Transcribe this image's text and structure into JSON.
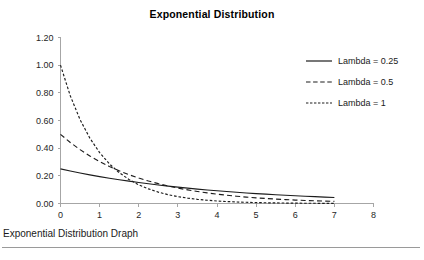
{
  "chart_data": {
    "type": "line",
    "title": "Exponential Distribution",
    "xlabel": "",
    "ylabel": "",
    "xlim": [
      0,
      8
    ],
    "ylim": [
      0,
      1.2
    ],
    "grid": false,
    "legend_position": "right",
    "xticks": [
      "0",
      "1",
      "2",
      "3",
      "4",
      "5",
      "6",
      "7",
      "8"
    ],
    "yticks": [
      "0.00",
      "0.20",
      "0.40",
      "0.60",
      "0.80",
      "1.00",
      "1.20"
    ],
    "x": [
      0,
      0.25,
      0.5,
      0.75,
      1,
      1.25,
      1.5,
      1.75,
      2,
      2.25,
      2.5,
      2.75,
      3,
      3.25,
      3.5,
      3.75,
      4,
      4.25,
      4.5,
      4.75,
      5,
      5.25,
      5.5,
      5.75,
      6,
      6.25,
      6.5,
      6.75,
      7
    ],
    "series": [
      {
        "name": "Lambda = 0.25",
        "lambda": 0.25,
        "style": "solid",
        "color": "#1c1c1c",
        "values": [
          0.25,
          0.2349,
          0.2206,
          0.2073,
          0.1947,
          0.1829,
          0.1718,
          0.1614,
          0.1516,
          0.1424,
          0.1338,
          0.1257,
          0.1181,
          0.1109,
          0.1042,
          0.0979,
          0.092,
          0.0864,
          0.0811,
          0.0762,
          0.0716,
          0.0673,
          0.0632,
          0.0594,
          0.0558,
          0.0524,
          0.0492,
          0.0462,
          0.0434
        ]
      },
      {
        "name": "Lambda = 0.5",
        "lambda": 0.5,
        "style": "dashed",
        "color": "#1c1c1c",
        "values": [
          0.5,
          0.4412,
          0.3894,
          0.3436,
          0.3033,
          0.2676,
          0.2362,
          0.2084,
          0.1839,
          0.1623,
          0.1433,
          0.1264,
          0.1116,
          0.0985,
          0.0869,
          0.0767,
          0.0677,
          0.0597,
          0.0527,
          0.0465,
          0.041,
          0.0362,
          0.032,
          0.0282,
          0.0249,
          0.022,
          0.0194,
          0.0171,
          0.0151
        ]
      },
      {
        "name": "Lambda = 1",
        "lambda": 1,
        "style": "dotted",
        "color": "#1c1c1c",
        "values": [
          1.0,
          0.7788,
          0.6065,
          0.4724,
          0.3679,
          0.2865,
          0.2231,
          0.1738,
          0.1353,
          0.1054,
          0.0821,
          0.0639,
          0.0498,
          0.0388,
          0.0302,
          0.0235,
          0.0183,
          0.0143,
          0.0111,
          0.0087,
          0.0067,
          0.0052,
          0.0041,
          0.0032,
          0.0025,
          0.0019,
          0.0015,
          0.0012,
          0.0009
        ]
      }
    ]
  },
  "legend": {
    "entries": [
      {
        "label": "Lambda = 0.25",
        "style": "solid"
      },
      {
        "label": "Lambda = 0.5",
        "style": "dashed"
      },
      {
        "label": "Lambda = 1",
        "style": "dotted"
      }
    ]
  },
  "caption": {
    "text": "Exponential Distribution Draph"
  }
}
